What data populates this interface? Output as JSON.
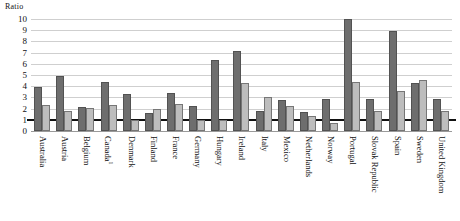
{
  "chart_data": {
    "type": "bar",
    "title": "",
    "subtitle": "",
    "unit_label": "Ratio",
    "xlabel": "",
    "ylabel": "Ratio",
    "ylim": [
      0,
      10
    ],
    "yticks": [
      10,
      9,
      8,
      7,
      6,
      5,
      4,
      3,
      2,
      1,
      0
    ],
    "grid": true,
    "legend_position": "none",
    "reference_line": 1,
    "annotations": [
      "Thick horizontal reference line drawn at ratio = 1"
    ],
    "footnotes": [
      "1"
    ],
    "categories": [
      "Australia",
      "Austria",
      "Belgium",
      "Canada",
      "Denmark",
      "Finland",
      "France",
      "Germany",
      "Hungary",
      "Ireland",
      "Italy",
      "Mexico",
      "Netherlands",
      "Norway",
      "Portugal",
      "Slovak Republic",
      "Spain",
      "Sweden",
      "United Kingdom"
    ],
    "category_footnotes": {
      "Canada": "1"
    },
    "series": [
      {
        "name": "series-1",
        "color": "#6e6e6e",
        "values": [
          3.9,
          4.9,
          2.1,
          4.4,
          3.3,
          1.65,
          3.35,
          2.2,
          6.35,
          7.1,
          1.8,
          2.8,
          1.7,
          2.9,
          10.0,
          2.9,
          8.9,
          4.25,
          2.9
        ]
      },
      {
        "name": "series-2",
        "color": "#bdbdbd",
        "values": [
          2.3,
          1.8,
          2.05,
          2.3,
          0.95,
          2.0,
          2.45,
          0.95,
          1.0,
          4.3,
          3.0,
          2.25,
          1.35,
          0.75,
          4.4,
          1.75,
          3.6,
          4.55,
          1.75
        ]
      }
    ]
  }
}
